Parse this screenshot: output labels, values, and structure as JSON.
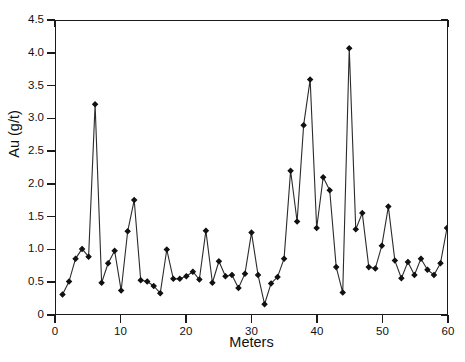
{
  "chart_data": {
    "type": "line",
    "title": "Successive 5-m composites",
    "xlabel": "Meters",
    "ylabel": "Au (g/t)",
    "xlim": [
      0,
      60
    ],
    "ylim": [
      0,
      4.5
    ],
    "xticks": [
      0,
      10,
      20,
      30,
      40,
      50,
      60
    ],
    "xtick_labels": [
      "0",
      "10",
      "20",
      "30",
      "40",
      "50",
      "60"
    ],
    "yticks": [
      0,
      0.5,
      1.0,
      1.5,
      2.0,
      2.5,
      3.0,
      3.5,
      4.0,
      4.5
    ],
    "ytick_labels": [
      "0",
      "0.5",
      "1.0",
      "1.5",
      "2.0",
      "2.5",
      "3.0",
      "3.5",
      "4.0",
      "4.5"
    ],
    "grid": false,
    "legend": false,
    "marker": "filled-diamond",
    "line_color": "#2b2b2b",
    "marker_color": "#111111",
    "series": [
      {
        "name": "Au grade",
        "x": [
          1,
          2,
          3,
          4,
          5,
          6,
          7,
          8,
          9,
          10,
          11,
          12,
          13,
          14,
          15,
          16,
          17,
          18,
          19,
          20,
          21,
          22,
          23,
          24,
          25,
          26,
          27,
          28,
          29,
          30,
          31,
          32,
          33,
          34,
          35,
          36,
          37,
          38,
          39,
          40,
          41,
          42,
          43,
          44,
          45,
          46,
          47,
          48,
          49,
          50,
          51,
          52,
          53,
          54,
          55,
          56,
          57,
          58,
          59,
          60
        ],
        "values": [
          0.3,
          0.5,
          0.85,
          1.0,
          0.88,
          3.22,
          0.48,
          0.78,
          0.97,
          0.36,
          1.27,
          1.75,
          0.52,
          0.5,
          0.43,
          0.32,
          0.99,
          0.54,
          0.54,
          0.58,
          0.65,
          0.53,
          1.28,
          0.48,
          0.81,
          0.58,
          0.6,
          0.4,
          0.62,
          1.25,
          0.6,
          0.15,
          0.47,
          0.57,
          0.85,
          2.2,
          1.42,
          2.9,
          3.6,
          1.32,
          2.1,
          1.9,
          0.72,
          0.33,
          4.08,
          1.3,
          1.55,
          0.72,
          0.7,
          1.05,
          1.65,
          0.82,
          0.55,
          0.8,
          0.6,
          0.85,
          0.68,
          0.6,
          0.78,
          1.32
        ]
      }
    ]
  },
  "figure": {
    "title": "Successive 5-m composites",
    "x_axis_title": "Meters",
    "y_axis_title": "Au (g/t)"
  }
}
